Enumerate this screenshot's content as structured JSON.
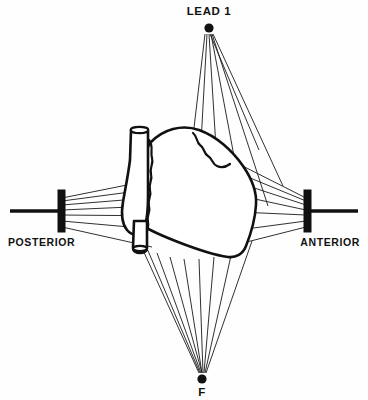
{
  "figure": {
    "background_color": "#fefefe",
    "ink_color": "#111111"
  },
  "labels": {
    "top": "LEAD 1",
    "bottom": "F",
    "left": "POSTERIOR",
    "right": "ANTERIOR"
  },
  "nodes": [
    {
      "name": "lead-1-node",
      "label": "LEAD 1",
      "x": 209,
      "y": 28,
      "radius": 4.6
    },
    {
      "name": "f-node",
      "label": "F",
      "x": 202,
      "y": 379,
      "radius": 4.6
    }
  ],
  "axis": {
    "name": "posterior-anterior-axis",
    "x1": 10,
    "x2": 358,
    "y": 211,
    "stroke_width": 3.4
  },
  "electrodes": [
    {
      "name": "posterior-electrode",
      "x": 58,
      "y": 190,
      "width": 7,
      "height": 42
    },
    {
      "name": "anterior-electrode",
      "x": 304,
      "y": 190,
      "width": 7,
      "height": 42
    }
  ],
  "ray_fans": [
    {
      "name": "lead-1-ray-fan",
      "origin_x": 209,
      "origin_y": 34,
      "count": 7,
      "targets": [
        [
          188,
          196
        ],
        [
          198,
          214
        ],
        [
          222,
          228
        ],
        [
          248,
          224
        ],
        [
          268,
          206
        ],
        [
          282,
          186
        ],
        [
          258,
          150
        ]
      ]
    },
    {
      "name": "f-ray-fan",
      "origin_x": 202,
      "origin_y": 373,
      "count": 9,
      "targets": [
        [
          138,
          238
        ],
        [
          146,
          246
        ],
        [
          157,
          252
        ],
        [
          170,
          256
        ],
        [
          184,
          258
        ],
        [
          199,
          258
        ],
        [
          214,
          256
        ],
        [
          232,
          250
        ],
        [
          252,
          240
        ]
      ]
    },
    {
      "name": "posterior-ray-fan",
      "origin_x": 62,
      "origin_y": 211,
      "count": 7,
      "targets": [
        [
          160,
          180
        ],
        [
          168,
          188
        ],
        [
          172,
          196
        ],
        [
          174,
          204
        ],
        [
          170,
          214
        ],
        [
          162,
          228
        ],
        [
          152,
          244
        ]
      ]
    },
    {
      "name": "anterior-ray-fan",
      "origin_x": 306,
      "origin_y": 211,
      "count": 7,
      "targets": [
        [
          214,
          152
        ],
        [
          226,
          168
        ],
        [
          236,
          182
        ],
        [
          240,
          196
        ],
        [
          238,
          212
        ],
        [
          230,
          230
        ],
        [
          218,
          248
        ]
      ]
    }
  ],
  "anatomy": {
    "name": "heart",
    "parts": [
      {
        "name": "great-vessel",
        "description": "aorta rising from upper-left of heart"
      },
      {
        "name": "ventricular-mass",
        "description": "main body of the heart"
      },
      {
        "name": "coronary-groove",
        "description": "wavy sulcus line on anterior surface"
      },
      {
        "name": "inferior-vein",
        "description": "small tubular vessel at lower-left"
      }
    ]
  }
}
